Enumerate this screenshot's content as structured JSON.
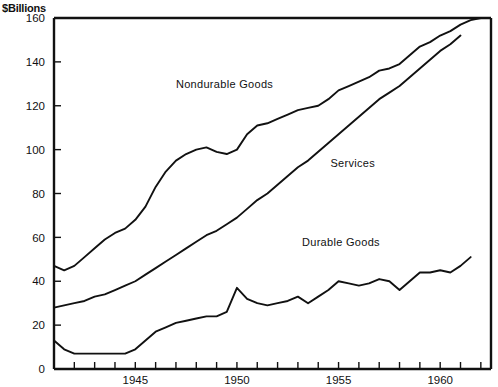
{
  "chart_data": {
    "type": "line",
    "title": "$Billions",
    "xlabel": "",
    "ylabel": "$Billions",
    "ylim": [
      0,
      160
    ],
    "xlim": [
      1941,
      1962.5
    ],
    "yticks": [
      0,
      20,
      40,
      60,
      80,
      100,
      120,
      140,
      160
    ],
    "ytick_labels": [
      "0",
      "20",
      "40",
      "60",
      "80",
      "100",
      "120",
      "140",
      "160"
    ],
    "xticks": [
      1941,
      1942,
      1943,
      1944,
      1945,
      1946,
      1947,
      1948,
      1949,
      1950,
      1951,
      1952,
      1953,
      1954,
      1955,
      1956,
      1957,
      1958,
      1959,
      1960,
      1961,
      1962
    ],
    "xtick_labels_shown": [
      "1945",
      "1950",
      "1955",
      "1960"
    ],
    "xtick_labels_shown_at": [
      1945,
      1950,
      1955,
      1960
    ],
    "grid": false,
    "legend": "inline-annotations",
    "annotations": [
      {
        "text": "Nondurable Goods",
        "x": 1947.0,
        "y": 128
      },
      {
        "text": "Services",
        "x": 1954.6,
        "y": 92
      },
      {
        "text": "Durable Goods",
        "x": 1953.2,
        "y": 56
      }
    ],
    "x": [
      1941,
      1941.5,
      1942,
      1942.5,
      1943,
      1943.5,
      1944,
      1944.5,
      1945,
      1945.5,
      1946,
      1946.5,
      1947,
      1947.5,
      1948,
      1948.5,
      1949,
      1949.5,
      1950,
      1950.5,
      1951,
      1951.5,
      1952,
      1952.5,
      1953,
      1953.5,
      1954,
      1954.5,
      1955,
      1955.5,
      1956,
      1956.5,
      1957,
      1957.5,
      1958,
      1958.5,
      1959,
      1959.5,
      1960,
      1960.5,
      1961,
      1961.5,
      1962
    ],
    "series": [
      {
        "name": "Nondurable Goods",
        "values": [
          47,
          45,
          47,
          51,
          55,
          59,
          62,
          64,
          68,
          74,
          83,
          90,
          95,
          98,
          100,
          101,
          99,
          98,
          100,
          107,
          111,
          112,
          114,
          116,
          118,
          119,
          120,
          123,
          127,
          129,
          131,
          133,
          136,
          137,
          139,
          143,
          147,
          149,
          152,
          154,
          157,
          159,
          161
        ]
      },
      {
        "name": "Services",
        "values": [
          28,
          29,
          30,
          31,
          33,
          34,
          36,
          38,
          40,
          43,
          46,
          49,
          52,
          55,
          58,
          61,
          63,
          66,
          69,
          73,
          77,
          80,
          84,
          88,
          92,
          95,
          99,
          103,
          107,
          111,
          115,
          119,
          123,
          126,
          129,
          133,
          137,
          141,
          145,
          148,
          152,
          null,
          null
        ]
      },
      {
        "name": "Durable Goods",
        "values": [
          13,
          9,
          7,
          7,
          7,
          7,
          7,
          7,
          9,
          13,
          17,
          19,
          21,
          22,
          23,
          24,
          24,
          26,
          37,
          32,
          30,
          29,
          30,
          31,
          33,
          30,
          33,
          36,
          40,
          39,
          38,
          39,
          41,
          40,
          36,
          40,
          44,
          44,
          45,
          44,
          47,
          51,
          null
        ]
      }
    ]
  }
}
